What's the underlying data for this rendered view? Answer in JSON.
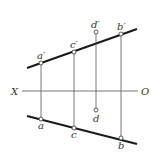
{
  "diagram": {
    "title": "",
    "axis": {
      "left_label": "X",
      "right_label": "O"
    },
    "points": {
      "a_prime": "a′",
      "c_prime": "c′",
      "d_prime": "d′",
      "b_prime": "b′",
      "a": "a",
      "c": "c",
      "d": "d",
      "b": "b"
    },
    "colors": {
      "line": "#1a1a1a",
      "thin": "#555555",
      "background": "#ffffff"
    }
  }
}
